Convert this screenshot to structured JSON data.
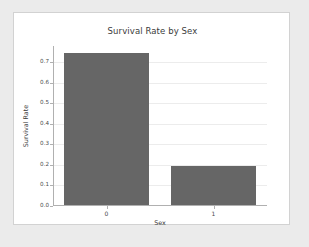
{
  "chart_data": {
    "type": "bar",
    "title": "Survival Rate by Sex",
    "xlabel": "Sex",
    "ylabel": "Survival Rate",
    "categories": [
      "0",
      "1"
    ],
    "values": [
      0.742,
      0.189
    ],
    "ylim": [
      0.0,
      0.78
    ],
    "yticks": [
      "0.0",
      "0.1",
      "0.2",
      "0.3",
      "0.4",
      "0.5",
      "0.6",
      "0.7"
    ],
    "ytick_values": [
      0.0,
      0.1,
      0.2,
      0.3,
      0.4,
      0.5,
      0.6,
      0.7
    ],
    "xticks": [
      "0",
      "1"
    ],
    "grid": true,
    "legend": false,
    "bar_color": "#666666",
    "grid_color": "#ececec",
    "axis_color": "#b0b0b0",
    "figure_background": "#ffffff",
    "page_background": "#ebebeb"
  }
}
